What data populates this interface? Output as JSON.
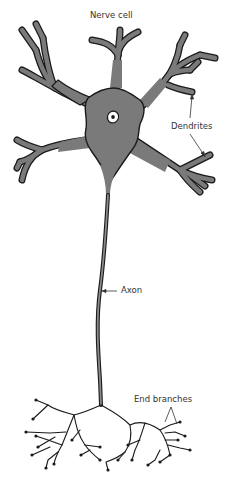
{
  "diagram": {
    "title": "Nerve cell",
    "labels": {
      "dendrites": "Dendrites",
      "axon": "Axon",
      "end_branches": "End branches"
    },
    "colors": {
      "cell_fill": "#7a7a7a",
      "outline": "#1a1a1a",
      "nucleus_fill": "#ffffff",
      "text": "#333333",
      "background": "#ffffff"
    }
  }
}
